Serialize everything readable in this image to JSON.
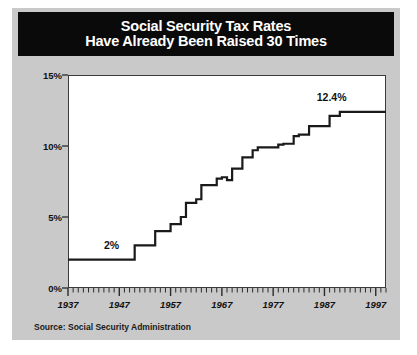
{
  "figure": {
    "title_line_1": "Social Security Tax Rates",
    "title_line_2": "Have Already Been Raised 30 Times",
    "source": "Source:  Social Security Administration",
    "panel_bg": "#c9c9c9",
    "title_bg": "#0a0a0a",
    "title_fg": "#ffffff",
    "plot_bg": "#ffffff",
    "line_color": "#1a1a1a"
  },
  "annotations": [
    {
      "name": "start-value-label",
      "text": "2%",
      "x": 1944,
      "y": 3.45
    },
    {
      "name": "end-value-label",
      "text": "12.4%",
      "x": 1985.5,
      "y": 13.9
    }
  ],
  "chart_data": {
    "type": "line",
    "title": "Social Security Tax Rates Have Already Been Raised 30 Times",
    "xlabel": "",
    "ylabel": "",
    "xlim": [
      1937,
      1999
    ],
    "ylim": [
      0,
      15
    ],
    "grid": false,
    "legend": false,
    "step": "post",
    "ytick_labels": [
      "0%",
      "5%",
      "10%",
      "15%"
    ],
    "ytick_values": [
      0,
      5,
      10,
      15
    ],
    "xtick_labels": [
      "1937",
      "1947",
      "1957",
      "1967",
      "1977",
      "1987",
      "1997"
    ],
    "xtick_values": [
      1937,
      1947,
      1957,
      1967,
      1977,
      1987,
      1997
    ],
    "minor_xtick_interval": 1,
    "series": [
      {
        "name": "Combined Social Security tax rate",
        "x": [
          1937,
          1950,
          1954,
          1957,
          1959,
          1960,
          1962,
          1963,
          1966,
          1967,
          1968,
          1969,
          1971,
          1973,
          1974,
          1978,
          1979,
          1981,
          1982,
          1984,
          1988,
          1990,
          1999
        ],
        "values": [
          2.0,
          3.0,
          4.0,
          4.5,
          5.0,
          6.0,
          6.25,
          7.25,
          7.7,
          7.8,
          7.6,
          8.4,
          9.2,
          9.7,
          9.9,
          10.1,
          10.16,
          10.7,
          10.8,
          11.4,
          12.12,
          12.4,
          12.4
        ]
      }
    ]
  }
}
